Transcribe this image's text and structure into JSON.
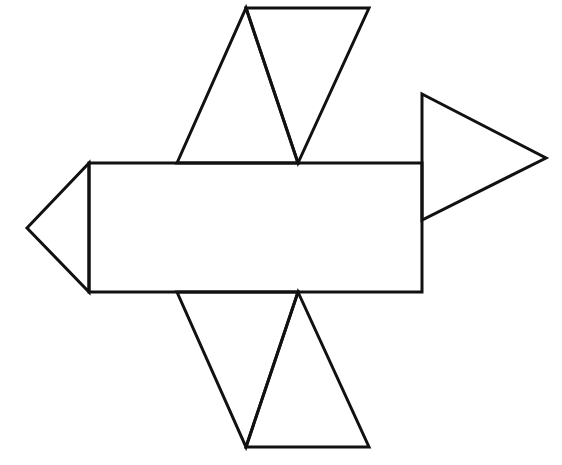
{
  "diagram": {
    "type": "net-of-solid",
    "style": {
      "stroke_color": "#111111",
      "stroke_width": 3,
      "background": "#ffffff",
      "fill": "#ffffff"
    },
    "shapes": [
      {
        "id": "center-rectangle",
        "kind": "rectangle",
        "points": [
          [
            89,
            163
          ],
          [
            422,
            163
          ],
          [
            422,
            292
          ],
          [
            89,
            292
          ]
        ]
      },
      {
        "id": "left-triangle",
        "kind": "triangle",
        "points": [
          [
            89,
            163
          ],
          [
            27,
            228
          ],
          [
            89,
            292
          ]
        ]
      },
      {
        "id": "right-triangle",
        "kind": "triangle",
        "points": [
          [
            422,
            94
          ],
          [
            546,
            158
          ],
          [
            422,
            220
          ]
        ]
      },
      {
        "id": "top-left-triangle",
        "kind": "triangle",
        "points": [
          [
            177,
            163
          ],
          [
            246,
            8
          ],
          [
            298,
            163
          ]
        ]
      },
      {
        "id": "top-right-triangle",
        "kind": "triangle",
        "points": [
          [
            246,
            8
          ],
          [
            369,
            8
          ],
          [
            298,
            163
          ]
        ]
      },
      {
        "id": "bottom-left-triangle",
        "kind": "triangle",
        "points": [
          [
            177,
            292
          ],
          [
            298,
            292
          ],
          [
            246,
            447
          ]
        ]
      },
      {
        "id": "bottom-right-triangle",
        "kind": "triangle",
        "points": [
          [
            298,
            292
          ],
          [
            369,
            447
          ],
          [
            246,
            447
          ]
        ]
      }
    ]
  }
}
